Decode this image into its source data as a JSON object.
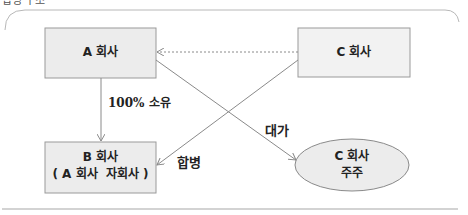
{
  "header": {
    "partial_title": "합병 구조"
  },
  "diagram": {
    "nodes": {
      "a": {
        "label": "A 회사"
      },
      "b": {
        "line1": "B 회사",
        "line2": "( A 회사  자회사 )"
      },
      "c": {
        "label": "C 회사"
      },
      "c_shareholders": {
        "line1": "C 회사",
        "line2": "주주"
      }
    },
    "edges": {
      "a_to_b": {
        "label": "100% 소유"
      },
      "c_to_b": {
        "label": "합병"
      },
      "a_to_shareholders": {
        "label": "대가"
      },
      "c_to_a": {
        "label": ""
      }
    },
    "colors": {
      "box_fill": "#ececec",
      "box_stroke": "#9a9a9a",
      "line": "#8a8a8a",
      "frame": "#b8b8b8"
    }
  }
}
